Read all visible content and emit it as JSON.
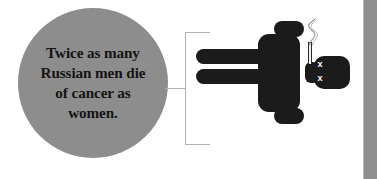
{
  "infographic": {
    "callout": {
      "text": "Twice as many\nRussian men die\nof cancer as\nwomen.",
      "circle_color": "#8d8d8d",
      "text_color": "#141414"
    },
    "bracket": {
      "color": "#b0b0b0"
    },
    "pictogram": {
      "label": "dead-male-smoker-figure",
      "body_color": "#1b1b1b",
      "eye_mark": "x",
      "eye_mark_color": "#ffffff",
      "cigarette_color": "#f2f2f2",
      "smoke_color": "#9a9a9a"
    },
    "page_edge": {
      "color": "#8e8e8e",
      "seam_color": "#b9b9b9"
    }
  }
}
